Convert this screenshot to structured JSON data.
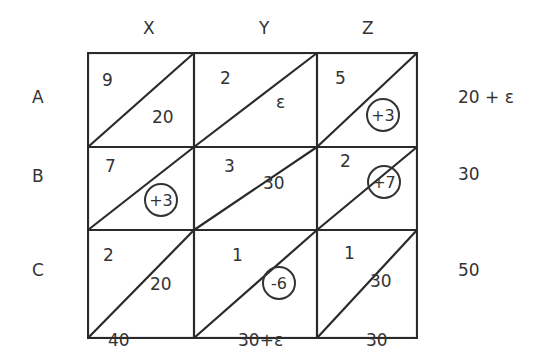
{
  "columns": [
    "X",
    "Y",
    "Z"
  ],
  "rows": [
    "A",
    "B",
    "C"
  ],
  "cells": [
    [
      {
        "cost": "9",
        "alloc": "20",
        "circled": false
      },
      {
        "cost": "2",
        "alloc": "ε",
        "circled": false
      },
      {
        "cost": "5",
        "alloc": "+3",
        "circled": true
      }
    ],
    [
      {
        "cost": "7",
        "alloc": "+3",
        "circled": true
      },
      {
        "cost": "3",
        "alloc": "30",
        "circled": false
      },
      {
        "cost": "2",
        "alloc": "+7",
        "circled": true
      }
    ],
    [
      {
        "cost": "2",
        "alloc": "20",
        "circled": false
      },
      {
        "cost": "1",
        "alloc": "-6",
        "circled": true
      },
      {
        "cost": "1",
        "alloc": "30",
        "circled": false
      }
    ]
  ],
  "supply": [
    "20 + ε",
    "30",
    "50"
  ],
  "demand": [
    "40",
    "30+ε",
    "30"
  ]
}
